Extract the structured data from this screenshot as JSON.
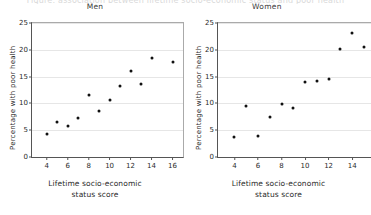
{
  "supertitle": "Figure: association between lifetime socio-economic status and poor health",
  "axes": {
    "ylabel": "Percentage with poor health",
    "xlabel_line1": "Lifetime socio-economic",
    "xlabel_line2": "status score",
    "yticks": [
      "0",
      "5",
      "10",
      "15",
      "20",
      "25"
    ],
    "ylim": [
      0,
      25
    ]
  },
  "chart_data": [
    {
      "type": "scatter",
      "title": "Men",
      "xlabel": "Lifetime socio-economic status score",
      "ylabel": "Percentage with poor health",
      "xlim": [
        2.6,
        17.0
      ],
      "ylim": [
        0,
        25
      ],
      "xticks": [
        4,
        6,
        8,
        10,
        12,
        14,
        16
      ],
      "yticks": [
        0,
        5,
        10,
        15,
        20,
        25
      ],
      "grid": "horizontal",
      "legend": "none",
      "x": [
        4,
        5,
        6,
        7,
        8,
        9,
        10,
        11,
        12,
        13,
        14,
        16
      ],
      "y": [
        4.2,
        6.6,
        5.8,
        7.2,
        11.5,
        8.5,
        10.6,
        13.2,
        16.1,
        13.6,
        18.4,
        17.8
      ]
    },
    {
      "type": "scatter",
      "title": "Women",
      "xlabel": "Lifetime socio-economic status score",
      "ylabel": "Percentage with poor health",
      "xlim": [
        2.6,
        15.6
      ],
      "ylim": [
        0,
        25
      ],
      "xticks": [
        4,
        6,
        8,
        10,
        12,
        14
      ],
      "yticks": [
        0,
        5,
        10,
        15,
        20,
        25
      ],
      "grid": "horizontal",
      "legend": "none",
      "clipped_right_edge": true,
      "x": [
        4,
        5,
        6,
        7,
        8,
        9,
        10,
        11,
        12,
        13,
        14,
        15
      ],
      "y": [
        3.8,
        9.5,
        3.9,
        7.5,
        9.9,
        9.1,
        13.9,
        14.1,
        14.6,
        20.1,
        23.2,
        20.5
      ]
    }
  ]
}
